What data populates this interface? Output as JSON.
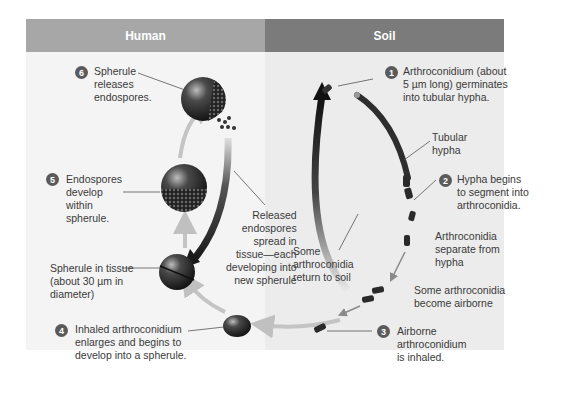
{
  "headers": {
    "human": "Human",
    "soil": "Soil"
  },
  "steps": [
    {
      "number": "1",
      "text": "Arthroconidium (about\n5 µm long) germinates\ninto tubular hypha."
    },
    {
      "number": "2",
      "text": "Hypha begins\nto segment into\narthroconidia."
    },
    {
      "number": "3",
      "text": "Airborne\narthroconidium\nis inhaled."
    },
    {
      "number": "4",
      "text": "Inhaled arthroconidium\nenlarges and begins to\ndevelop into a spherule."
    },
    {
      "number": "5",
      "text": "Endospores\ndevelop\nwithin\nspherule."
    },
    {
      "number": "6",
      "text": "Spherule\nreleases\nendospores."
    }
  ],
  "annotations": {
    "tubular_hypha": "Tubular\nhypha",
    "separate": "Arthroconidia\nseparate from\nhypha",
    "airborne": "Some arthroconidia\nbecome airborne",
    "return_soil": "Some\narthroconidia\nreturn to soil",
    "released": "Released\nendospores\nspread in\ntissue—each\ndeveloping into\nnew spherule",
    "spherule_tissue": "Spherule in tissue\n(about 30 µm in\ndiameter)"
  },
  "colors": {
    "human_header": "#a7a7a7",
    "soil_header": "#7b7b7b",
    "step_badge": "#5a5a5a",
    "arrow_light": "#c0c0c0",
    "arrow_dark": "#2a2a2a"
  }
}
